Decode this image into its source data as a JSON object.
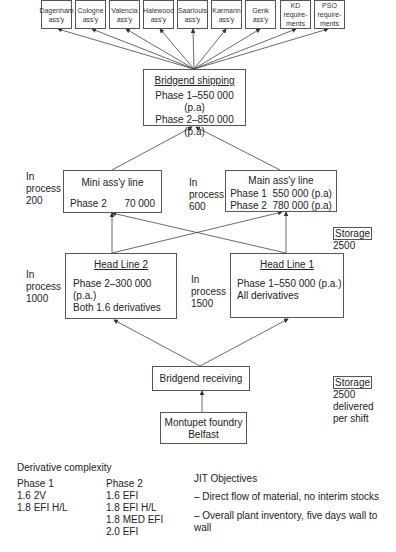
{
  "destinations": [
    {
      "line1": "Dagenham",
      "line2": "ass'y"
    },
    {
      "line1": "Cologne",
      "line2": "ass'y"
    },
    {
      "line1": "Valencia",
      "line2": "ass'y"
    },
    {
      "line1": "Halewood",
      "line2": "ass'y"
    },
    {
      "line1": "Saarlouis",
      "line2": "ass'y"
    },
    {
      "line1": "Karmann",
      "line2": "ass'y"
    },
    {
      "line1": "Genk",
      "line2": "ass'y"
    },
    {
      "line1": "KD",
      "line2": "require-",
      "line3": "ments"
    },
    {
      "line1": "PSO",
      "line2": "require-",
      "line3": "ments"
    }
  ],
  "shipping": {
    "title": "Bridgend shipping",
    "phase1": "Phase 1–550 000 (p.a)",
    "phase2": "Phase 2–850 000 (p.a)"
  },
  "mini_line": {
    "title": "Mini ass'y line",
    "phase": "Phase 2",
    "volume": "70 000",
    "wip": [
      "In",
      "process",
      "200"
    ]
  },
  "main_line": {
    "title": "Main ass'y line",
    "phase1": "Phase 1  550 000 (p.a)",
    "phase2": "Phase 2  780 000 (p.a)",
    "wip": [
      "In",
      "process",
      "600"
    ]
  },
  "storage_mid": {
    "label": "Storage",
    "value": "2500"
  },
  "head_line_2": {
    "title": "Head Line 2",
    "line1": "Phase 2–300 000 (p.a.)",
    "line2": "Both 1.6 derivatives",
    "wip": [
      "In",
      "process",
      "1000"
    ]
  },
  "head_line_1": {
    "title": "Head Line 1",
    "line1": "Phase 1–550 000 (p.a.)",
    "line2": "All derivatives",
    "wip": [
      "In",
      "process",
      "1500"
    ]
  },
  "receiving": {
    "title": "Bridgend receiving"
  },
  "storage_bottom": {
    "label": "Storage",
    "value": "2500",
    "line2": "delivered",
    "line3": "per shift"
  },
  "foundry": {
    "line1": "Montupet foundry",
    "line2": "Belfast"
  },
  "derivative_complexity": {
    "title": "Derivative complexity",
    "phase1": {
      "heading": "Phase 1",
      "items": [
        "1.6 2V",
        "1.8 EFI H/L"
      ]
    },
    "phase2": {
      "heading": "Phase 2",
      "items": [
        "1.6 EFI",
        "1.8 EFI H/L",
        "1.8 MED EFI",
        "2.0 EFI"
      ]
    }
  },
  "jit": {
    "title": "JIT Objectives",
    "items": [
      "– Direct flow of material, no interim stocks",
      "– Overall plant inventory, five days wall to wall"
    ]
  }
}
